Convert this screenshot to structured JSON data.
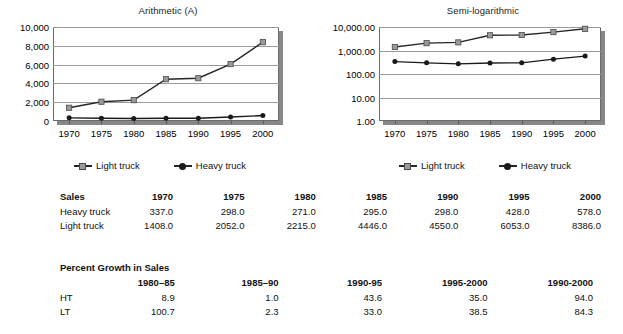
{
  "chart_data": [
    {
      "type": "line",
      "id": "arithmetic",
      "title": "Arithmetic (A)",
      "xlabel": "",
      "ylabel": "",
      "x": [
        1970,
        1975,
        1980,
        1985,
        1990,
        1995,
        2000
      ],
      "xticklabels": [
        "1970",
        "1975",
        "1980",
        "1985",
        "1990",
        "1995",
        "2000"
      ],
      "yticks": [
        0,
        2000,
        4000,
        6000,
        8000,
        10000
      ],
      "yticklabels": [
        "0",
        "2,000",
        "4,000",
        "6,000",
        "8,000",
        "10,000"
      ],
      "ylim": [
        0,
        10000
      ],
      "yscale": "linear",
      "grid": "horizontal",
      "legend_position": "bottom",
      "series": [
        {
          "name": "Light truck",
          "marker": "square",
          "color": "#9a9a9a",
          "line_color": "#262626",
          "values": [
            1408.0,
            2052.0,
            2215.0,
            4446.0,
            4550.0,
            6053.0,
            8386.0
          ]
        },
        {
          "name": "Heavy truck",
          "marker": "circle",
          "color": "#1a1a1a",
          "line_color": "#1a1a1a",
          "values": [
            337.0,
            298.0,
            271.0,
            295.0,
            298.0,
            428.0,
            578.0
          ]
        }
      ]
    },
    {
      "type": "line",
      "id": "semilog",
      "title": "Semi-logarithmic",
      "xlabel": "",
      "ylabel": "",
      "x": [
        1970,
        1975,
        1980,
        1985,
        1990,
        1995,
        2000
      ],
      "xticklabels": [
        "1970",
        "1975",
        "1980",
        "1985",
        "1990",
        "1995",
        "2000"
      ],
      "yticks": [
        1,
        10,
        100,
        1000,
        10000
      ],
      "yticklabels": [
        "1.00",
        "10.00",
        "100.00",
        "1,000.00",
        "10,000.00"
      ],
      "ylim": [
        1,
        10000
      ],
      "yscale": "log",
      "grid": "horizontal",
      "legend_position": "bottom",
      "series": [
        {
          "name": "Light truck",
          "marker": "square",
          "color": "#9a9a9a",
          "line_color": "#262626",
          "values": [
            1408.0,
            2052.0,
            2215.0,
            4446.0,
            4550.0,
            6053.0,
            8386.0
          ]
        },
        {
          "name": "Heavy truck",
          "marker": "circle",
          "color": "#1a1a1a",
          "line_color": "#1a1a1a",
          "values": [
            337.0,
            298.0,
            271.0,
            295.0,
            298.0,
            428.0,
            578.0
          ]
        }
      ]
    },
    {
      "type": "table",
      "id": "sales-table",
      "title": "Sales",
      "columns": [
        "Sales",
        "1970",
        "1975",
        "1980",
        "1985",
        "1990",
        "1995",
        "2000"
      ],
      "rows": [
        {
          "label": "Heavy truck",
          "values": [
            "337.0",
            "298.0",
            "271.0",
            "295.0",
            "298.0",
            "428.0",
            "578.0"
          ]
        },
        {
          "label": "Light truck",
          "values": [
            "1408.0",
            "2052.0",
            "2215.0",
            "4446.0",
            "4550.0",
            "6053.0",
            "8386.0"
          ]
        }
      ]
    },
    {
      "type": "table",
      "id": "growth-table",
      "title": "Percent Growth in Sales",
      "columns": [
        "",
        "1980–85",
        "1985–90",
        "1990-95",
        "1995-2000",
        "1990-2000"
      ],
      "rows": [
        {
          "label": "HT",
          "values": [
            "8.9",
            "1.0",
            "43.6",
            "35.0",
            "94.0"
          ]
        },
        {
          "label": "LT",
          "values": [
            "100.7",
            "2.3",
            "33.0",
            "38.5",
            "84.3"
          ]
        }
      ]
    }
  ],
  "charts": {
    "arithmetic": {
      "title": "Arithmetic (A)",
      "legend": [
        {
          "label": "Light truck"
        },
        {
          "label": "Heavy truck"
        }
      ]
    },
    "semilog": {
      "title": "Semi-logarithmic",
      "legend": [
        {
          "label": "Light truck"
        },
        {
          "label": "Heavy truck"
        }
      ]
    }
  },
  "tables": {
    "sales": {
      "header": [
        "Sales",
        "1970",
        "1975",
        "1980",
        "1985",
        "1990",
        "1995",
        "2000"
      ],
      "rows": [
        [
          "Heavy truck",
          "337.0",
          "298.0",
          "271.0",
          "295.0",
          "298.0",
          "428.0",
          "578.0"
        ],
        [
          "Light truck",
          "1408.0",
          "2052.0",
          "2215.0",
          "4446.0",
          "4550.0",
          "6053.0",
          "8386.0"
        ]
      ]
    },
    "growth": {
      "caption": "Percent Growth in Sales",
      "header": [
        "",
        "1980–85",
        "1985–90",
        "1990-95",
        "1995-2000",
        "1990-2000"
      ],
      "rows": [
        [
          "HT",
          "8.9",
          "1.0",
          "43.6",
          "35.0",
          "94.0"
        ],
        [
          "LT",
          "100.7",
          "2.3",
          "33.0",
          "38.5",
          "84.3"
        ]
      ]
    }
  }
}
